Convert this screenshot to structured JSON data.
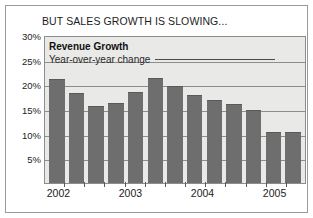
{
  "headline": "BUT SALES GROWTH IS SLOWING...",
  "legend": {
    "title": "Revenue Growth",
    "subtitle": "Year-over-year change"
  },
  "colors": {
    "bar": "#6e6e6e",
    "plot_background": "#e9e9e7",
    "gridline": "#8d8d8d",
    "frame": "#9a9a9a",
    "text": "#1c1c1c"
  },
  "chart_data": {
    "type": "bar",
    "title": "Revenue Growth",
    "subtitle": "Year-over-year change",
    "xlabel": "",
    "ylabel": "",
    "ylim": [
      0,
      30
    ],
    "yticks": [
      5,
      10,
      15,
      20,
      25,
      30
    ],
    "ytick_labels": [
      "5%",
      "10%",
      "15%",
      "20%",
      "25%",
      "30%"
    ],
    "grid": true,
    "legend_position": "inside-top-left",
    "categories": [
      "2002 Q1",
      "2002 Q2",
      "2002 Q3",
      "2002 Q4",
      "2003 Q1",
      "2003 Q2",
      "2003 Q3",
      "2003 Q4",
      "2004 Q1",
      "2004 Q2",
      "2004 Q3",
      "2004 Q4",
      "2005 Q1"
    ],
    "values": [
      21.0,
      18.3,
      15.6,
      16.2,
      18.4,
      21.2,
      19.7,
      17.8,
      16.9,
      16.1,
      14.8,
      10.4,
      10.4
    ],
    "xtick_labels": [
      "2002",
      "2003",
      "2004",
      "2005"
    ],
    "xtick_positions": [
      0.055,
      0.33,
      0.605,
      0.88
    ]
  }
}
